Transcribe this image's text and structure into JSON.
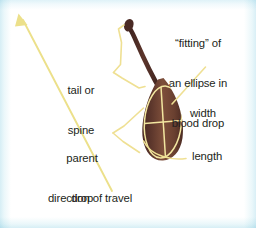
{
  "figure": {
    "background_color": "#ffffff",
    "edge_tint_color": "#d6eef5"
  },
  "colors": {
    "drop_fill": "#7a4a38",
    "drop_fill_dark": "#4a2a24",
    "drop_edge": "#3f2420",
    "leader_line": "#efe093",
    "arrow": "#ece08a",
    "ellipse_line": "#f2e6a0",
    "text": "#231f20"
  },
  "labels": {
    "fitting": {
      "line1": "“fitting” of",
      "line2": "an ellipse in",
      "line3": "blood drop"
    },
    "tail": {
      "line1": "tail or",
      "line2": "spine"
    },
    "parent": {
      "line1": "parent",
      "line2": "drop"
    },
    "width": "width",
    "length": "length",
    "direction": "direction of travel"
  },
  "annotations": {
    "arrow_name": "direction-of-travel-arrow",
    "arrow_points_to": "upper-left",
    "stain_name": "blood-stain-with-tail",
    "ellipse_axes": [
      "length",
      "width"
    ]
  }
}
